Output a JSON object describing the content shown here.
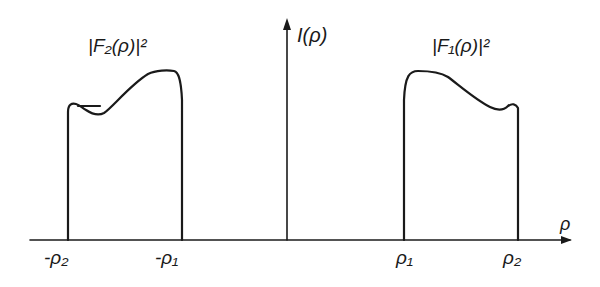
{
  "figure": {
    "y_axis_label": "I(ρ)",
    "x_axis_label": "ρ",
    "curves": [
      {
        "name": "F2",
        "label": "|F₂(ρ)|²",
        "range": [
          "-ρ₂",
          "-ρ₁"
        ]
      },
      {
        "name": "F1",
        "label": "|F₁(ρ)|²",
        "range": [
          "ρ₁",
          "ρ₂"
        ]
      }
    ],
    "tick_labels": [
      "-ρ₂",
      "-ρ₁",
      "ρ₁",
      "ρ₂"
    ]
  }
}
